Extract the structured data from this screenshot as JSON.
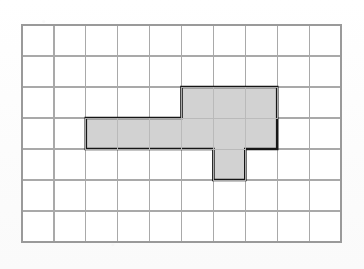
{
  "figure": {
    "description": "A 10 by 7 square grid with one shaded polygon outlined in heavy black.",
    "background_color": "#fdfdfd",
    "grid": {
      "columns": 10,
      "rows": 7,
      "origin_x": 22,
      "origin_y": 25,
      "cell_width": 31.9,
      "cell_height": 31.0,
      "line_color": "#a9a9a9",
      "line_width": 1.2,
      "border_color": "#9a9a9a",
      "border_width": 1.4,
      "cell_fill": "#ffffff"
    },
    "polygon": {
      "name": "shaded-polygon",
      "fill_color": "#d2d2d2",
      "stroke_color": "#161616",
      "stroke_width": 2.6,
      "unit_squares": 9,
      "perimeter_units": 20,
      "vertices_grid": [
        [
          2,
          3
        ],
        [
          5,
          3
        ],
        [
          5,
          2
        ],
        [
          8,
          2
        ],
        [
          8,
          4
        ],
        [
          7,
          4
        ],
        [
          7,
          5
        ],
        [
          6,
          5
        ],
        [
          6,
          4
        ],
        [
          2,
          4
        ]
      ],
      "filled_cells": [
        [
          2,
          3
        ],
        [
          3,
          3
        ],
        [
          4,
          3
        ],
        [
          5,
          3
        ],
        [
          6,
          3
        ],
        [
          5,
          2
        ],
        [
          6,
          2
        ],
        [
          7,
          2
        ],
        [
          6,
          4
        ]
      ]
    }
  }
}
